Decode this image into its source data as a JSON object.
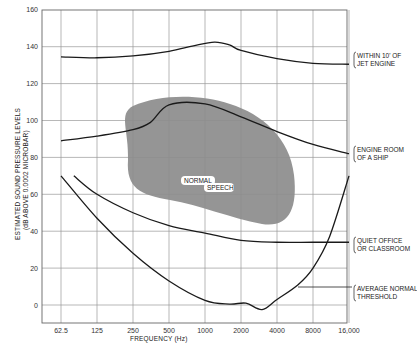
{
  "chart_data": {
    "type": "line",
    "title": "",
    "xlabel": "FREQUENCY    (Hz)",
    "ylabel": "ESTIMATED SOUND PRESSURE LEVELS",
    "ylabel2": "(dB ABOVE 0.0002 MICROBAR)",
    "x_scale": "log2",
    "x_ticks": [
      "62.5",
      "125",
      "250",
      "500",
      "1000",
      "2000",
      "4000",
      "8000",
      "16,000"
    ],
    "x_values": [
      62.5,
      125,
      250,
      500,
      1000,
      2000,
      4000,
      8000,
      16000
    ],
    "y_ticks": [
      "160",
      "140",
      "120",
      "100",
      "80",
      "60",
      "40",
      "20",
      "0"
    ],
    "ylim": [
      -10,
      160
    ],
    "grid": true,
    "series": [
      {
        "name": "WITHIN 10' OF JET ENGINE",
        "label_lines": [
          "WITHIN 10' OF",
          "JET ENGINE"
        ],
        "points": [
          [
            62.5,
            134.5
          ],
          [
            125,
            134
          ],
          [
            250,
            135
          ],
          [
            500,
            137.5
          ],
          [
            800,
            140.5
          ],
          [
            1200,
            142.5
          ],
          [
            1600,
            141
          ],
          [
            2000,
            138
          ],
          [
            4000,
            133.5
          ],
          [
            8000,
            131
          ],
          [
            16000,
            130.5
          ]
        ]
      },
      {
        "name": "ENGINE ROOM OF A SHIP",
        "label_lines": [
          "ENGINE ROOM",
          "OF A SHIP"
        ],
        "points": [
          [
            62.5,
            89
          ],
          [
            125,
            91.5
          ],
          [
            250,
            95
          ],
          [
            350,
            99
          ],
          [
            500,
            108.5
          ],
          [
            1000,
            109
          ],
          [
            2000,
            102
          ],
          [
            4000,
            94
          ],
          [
            8000,
            87
          ],
          [
            16000,
            82
          ]
        ]
      },
      {
        "name": "QUIET OFFICE OR CLASSROOM",
        "label_lines": [
          "QUIET OFFICE",
          "OR CLASSROOM"
        ],
        "points": [
          [
            80,
            70
          ],
          [
            125,
            60
          ],
          [
            250,
            50
          ],
          [
            500,
            43
          ],
          [
            1000,
            39
          ],
          [
            2000,
            35
          ],
          [
            4000,
            34
          ],
          [
            8000,
            34
          ],
          [
            16000,
            34
          ]
        ]
      },
      {
        "name": "AVERAGE NORMAL THRESHOLD",
        "label_lines": [
          "AVERAGE NORMAL",
          "THRESHOLD"
        ],
        "points": [
          [
            62.5,
            70
          ],
          [
            125,
            47
          ],
          [
            250,
            28
          ],
          [
            500,
            13
          ],
          [
            1000,
            2.5
          ],
          [
            1600,
            0.5
          ],
          [
            2200,
            1
          ],
          [
            3000,
            -2.5
          ],
          [
            4000,
            3
          ],
          [
            6000,
            11
          ],
          [
            8000,
            20
          ],
          [
            11000,
            37
          ],
          [
            16000,
            70
          ]
        ]
      }
    ],
    "regions": [
      {
        "name": "NORMAL SPEECH",
        "label_lines": [
          "NORMAL",
          "SPEECH"
        ],
        "color": "#8a8a8a",
        "approx_range": {
          "freq": [
            200,
            5000
          ],
          "db": [
            40,
            78
          ]
        }
      }
    ]
  }
}
